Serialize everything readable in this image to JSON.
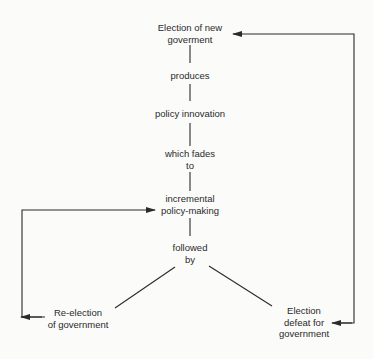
{
  "diagram": {
    "type": "cycle-flowchart",
    "nodes": {
      "election_new": {
        "lines": [
          "Election of new",
          "goverment"
        ]
      },
      "produces": {
        "lines": [
          "produces"
        ]
      },
      "policy_innovation": {
        "lines": [
          "policy innovation"
        ]
      },
      "which_fades": {
        "lines": [
          "which fades",
          "to"
        ]
      },
      "incremental": {
        "lines": [
          "incremental",
          "policy-making"
        ]
      },
      "followed_by": {
        "lines": [
          "followed",
          "by"
        ]
      },
      "reelection": {
        "lines": [
          "Re-election",
          "of government"
        ]
      },
      "defeat": {
        "lines": [
          "Election",
          "defeat for",
          "government"
        ]
      }
    },
    "edges": [
      {
        "from": "election_new",
        "to": "produces",
        "style": "line"
      },
      {
        "from": "produces",
        "to": "policy_innovation",
        "style": "line"
      },
      {
        "from": "policy_innovation",
        "to": "which_fades",
        "style": "line"
      },
      {
        "from": "which_fades",
        "to": "incremental",
        "style": "line"
      },
      {
        "from": "incremental",
        "to": "followed_by",
        "style": "line"
      },
      {
        "from": "followed_by",
        "to": "reelection",
        "style": "diagonal"
      },
      {
        "from": "followed_by",
        "to": "defeat",
        "style": "diagonal"
      },
      {
        "from": "reelection",
        "to": "incremental",
        "style": "arrow-loop-left"
      },
      {
        "from": "defeat",
        "to": "election_new",
        "style": "arrow-loop-right"
      }
    ],
    "colors": {
      "background": "#fbfbfa",
      "ink": "#2a2a2a"
    }
  }
}
